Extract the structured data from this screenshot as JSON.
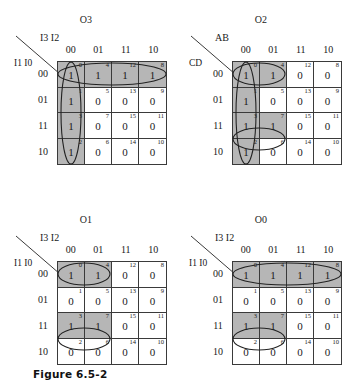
{
  "figure": {
    "caption": "Figure 6.5-2"
  },
  "maps": [
    {
      "title": "O3",
      "position": "top-left",
      "axis_top_label": "I3 I2",
      "axis_left_label": "I1 I0",
      "col_headers": [
        "00",
        "01",
        "11",
        "10"
      ],
      "row_headers": [
        "00",
        "01",
        "11",
        "10"
      ],
      "cells": [
        {
          "index": "0",
          "value": "1",
          "on": true
        },
        {
          "index": "4",
          "value": "1",
          "on": true
        },
        {
          "index": "12",
          "value": "1",
          "on": true
        },
        {
          "index": "8",
          "value": "1",
          "on": true
        },
        {
          "index": "1",
          "value": "1",
          "on": true
        },
        {
          "index": "5",
          "value": "0",
          "on": false
        },
        {
          "index": "13",
          "value": "0",
          "on": false
        },
        {
          "index": "9",
          "value": "0",
          "on": false
        },
        {
          "index": "3",
          "value": "1",
          "on": true
        },
        {
          "index": "7",
          "value": "0",
          "on": false
        },
        {
          "index": "15",
          "value": "0",
          "on": false
        },
        {
          "index": "11",
          "value": "0",
          "on": false
        },
        {
          "index": "2",
          "value": "1",
          "on": true
        },
        {
          "index": "6",
          "value": "0",
          "on": false
        },
        {
          "index": "14",
          "value": "0",
          "on": false
        },
        {
          "index": "10",
          "value": "0",
          "on": false
        }
      ],
      "groups": [
        {
          "name": "group-top-row",
          "cx": 55,
          "cy": 13,
          "rx": 54,
          "ry": 11,
          "rotate": 0
        },
        {
          "name": "group-left-column",
          "cx": 14,
          "cy": 52,
          "rx": 10,
          "ry": 51,
          "rotate": 0
        }
      ]
    },
    {
      "title": "O2",
      "position": "top-right",
      "axis_top_label": "AB",
      "axis_left_label": "CD",
      "col_headers": [
        "00",
        "01",
        "11",
        "10"
      ],
      "row_headers": [
        "00",
        "01",
        "11",
        "10"
      ],
      "cells": [
        {
          "index": "0",
          "value": "1",
          "on": true
        },
        {
          "index": "4",
          "value": "1",
          "on": true
        },
        {
          "index": "12",
          "value": "0",
          "on": false
        },
        {
          "index": "8",
          "value": "0",
          "on": false
        },
        {
          "index": "1",
          "value": "1",
          "on": true
        },
        {
          "index": "5",
          "value": "0",
          "on": false
        },
        {
          "index": "13",
          "value": "0",
          "on": false
        },
        {
          "index": "9",
          "value": "0",
          "on": false
        },
        {
          "index": "3",
          "value": "1",
          "on": true
        },
        {
          "index": "7",
          "value": "1",
          "on": true
        },
        {
          "index": "15",
          "value": "0",
          "on": false
        },
        {
          "index": "11",
          "value": "0",
          "on": false
        },
        {
          "index": "2",
          "value": "1",
          "on": true
        },
        {
          "index": "6",
          "value": "0",
          "on": false
        },
        {
          "index": "14",
          "value": "0",
          "on": false
        },
        {
          "index": "10",
          "value": "0",
          "on": false
        }
      ],
      "groups": [
        {
          "name": "group-left-column",
          "cx": 14,
          "cy": 52,
          "rx": 10,
          "ry": 51,
          "rotate": 0
        },
        {
          "name": "group-row00-pair",
          "cx": 27,
          "cy": 13,
          "rx": 26,
          "ry": 11,
          "rotate": 0
        },
        {
          "name": "group-row11-pair",
          "cx": 27,
          "cy": 78,
          "rx": 26,
          "ry": 11,
          "rotate": 0
        }
      ]
    },
    {
      "title": "O1",
      "position": "bottom-left",
      "axis_top_label": "I3 I2",
      "axis_left_label": "I1 I0",
      "col_headers": [
        "00",
        "01",
        "11",
        "10"
      ],
      "row_headers": [
        "00",
        "01",
        "11",
        "10"
      ],
      "cells": [
        {
          "index": "0",
          "value": "1",
          "on": true
        },
        {
          "index": "4",
          "value": "1",
          "on": true
        },
        {
          "index": "12",
          "value": "0",
          "on": false
        },
        {
          "index": "8",
          "value": "0",
          "on": false
        },
        {
          "index": "1",
          "value": "0",
          "on": false
        },
        {
          "index": "5",
          "value": "0",
          "on": false
        },
        {
          "index": "13",
          "value": "0",
          "on": false
        },
        {
          "index": "9",
          "value": "0",
          "on": false
        },
        {
          "index": "3",
          "value": "1",
          "on": true
        },
        {
          "index": "7",
          "value": "1",
          "on": true
        },
        {
          "index": "15",
          "value": "0",
          "on": false
        },
        {
          "index": "11",
          "value": "0",
          "on": false
        },
        {
          "index": "2",
          "value": "0",
          "on": false
        },
        {
          "index": "6",
          "value": "0",
          "on": false
        },
        {
          "index": "14",
          "value": "0",
          "on": false
        },
        {
          "index": "10",
          "value": "0",
          "on": false
        }
      ],
      "groups": [
        {
          "name": "group-row00-pair",
          "cx": 27,
          "cy": 13,
          "rx": 26,
          "ry": 11,
          "rotate": 0
        },
        {
          "name": "group-row11-pair",
          "cx": 27,
          "cy": 78,
          "rx": 26,
          "ry": 11,
          "rotate": 0
        }
      ]
    },
    {
      "title": "O0",
      "position": "bottom-right",
      "axis_top_label": "I3 I2",
      "axis_left_label": "I1 I0",
      "col_headers": [
        "00",
        "01",
        "11",
        "10"
      ],
      "row_headers": [
        "00",
        "01",
        "11",
        "10"
      ],
      "cells": [
        {
          "index": "0",
          "value": "1",
          "on": true
        },
        {
          "index": "4",
          "value": "1",
          "on": true
        },
        {
          "index": "12",
          "value": "1",
          "on": true
        },
        {
          "index": "8",
          "value": "1",
          "on": true
        },
        {
          "index": "1",
          "value": "0",
          "on": false
        },
        {
          "index": "5",
          "value": "0",
          "on": false
        },
        {
          "index": "13",
          "value": "0",
          "on": false
        },
        {
          "index": "9",
          "value": "0",
          "on": false
        },
        {
          "index": "3",
          "value": "1",
          "on": true
        },
        {
          "index": "7",
          "value": "1",
          "on": true
        },
        {
          "index": "15",
          "value": "0",
          "on": false
        },
        {
          "index": "11",
          "value": "0",
          "on": false
        },
        {
          "index": "2",
          "value": "0",
          "on": false
        },
        {
          "index": "6",
          "value": "0",
          "on": false
        },
        {
          "index": "14",
          "value": "0",
          "on": false
        },
        {
          "index": "10",
          "value": "0",
          "on": false
        }
      ],
      "groups": [
        {
          "name": "group-top-row",
          "cx": 55,
          "cy": 13,
          "rx": 54,
          "ry": 11,
          "rotate": 0
        },
        {
          "name": "group-row11-pair",
          "cx": 27,
          "cy": 78,
          "rx": 26,
          "ry": 11,
          "rotate": 0
        }
      ]
    }
  ]
}
